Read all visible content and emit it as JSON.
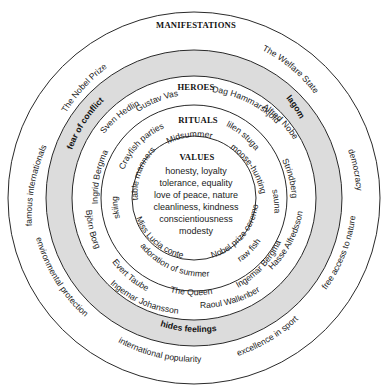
{
  "diagram": {
    "center": [
      194,
      198
    ],
    "radii": {
      "outer": 186,
      "shade_outer": 148,
      "shade_inner": 122,
      "rituals_outer": 93,
      "values": 62
    },
    "colors": {
      "shade": "#dcdcdc",
      "line": "#2a2a2a",
      "text": "#1a1a1a"
    }
  },
  "layers": {
    "manifestations": {
      "title": "MANIFESTATIONS"
    },
    "heroes": {
      "title": "HEROES"
    },
    "rituals": {
      "title": "RITUALS"
    },
    "values": {
      "title": "VALUES",
      "lines": [
        "honesty, loyalty",
        "tolerance, equality",
        "love of peace, nature",
        "cleanliness, kindness",
        "conscientiousness",
        "modesty"
      ]
    }
  },
  "outer_ring_labels": [
    {
      "text": "The Nobel Prize"
    },
    {
      "text": "The Welfare State"
    },
    {
      "text": "famous internationals"
    },
    {
      "text": "democracy"
    },
    {
      "text": "environmental protection"
    },
    {
      "text": "free access to nature"
    },
    {
      "text": "international popularity"
    },
    {
      "text": "excellence in sport"
    }
  ],
  "shaded_ring_labels": [
    {
      "text": "fear of conflict"
    },
    {
      "text": "lagom"
    },
    {
      "text": "hides feelings"
    }
  ],
  "heroes_labels": [
    {
      "text": "Sven Hedlin"
    },
    {
      "text": "Gustav Vasa"
    },
    {
      "text": "Dag Hammarskjöld"
    },
    {
      "text": "Alfred Nobel"
    },
    {
      "text": "Ingrid Bergman"
    },
    {
      "text": "Strindberg"
    },
    {
      "text": "Björn Borg"
    },
    {
      "text": "Hasse Alfredsson"
    },
    {
      "text": "Evert Taube"
    },
    {
      "text": "Ingemar Bergman"
    },
    {
      "text": "Ingemar Johansson"
    },
    {
      "text": "The Queen"
    },
    {
      "text": "Raoul Wallenberg"
    }
  ],
  "rituals_labels": [
    {
      "text": "Crayfish parties"
    },
    {
      "text": "Midsummer"
    },
    {
      "text": "lilen stuga"
    },
    {
      "text": "table manners"
    },
    {
      "text": "moose-hunting"
    },
    {
      "text": "skiing"
    },
    {
      "text": "sauna"
    },
    {
      "text": "Miss Lucia contest"
    },
    {
      "text": "Nobel prize ceremony"
    },
    {
      "text": "adoration of summer"
    },
    {
      "text": "raw fish"
    }
  ]
}
